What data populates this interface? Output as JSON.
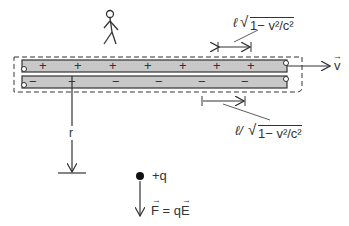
{
  "diagram": {
    "wire_top_charges": [
      "+",
      "+",
      "+",
      "+",
      "+",
      "+",
      "+"
    ],
    "wire_bottom_charges": [
      "−",
      "−",
      "−",
      "−",
      "−",
      "−"
    ],
    "velocity_label": "v",
    "top_spacing_label_l": "ℓ",
    "top_spacing_label_root": "1− v²/c²",
    "bottom_spacing_label_prefix": "ℓ/",
    "bottom_spacing_label_root": "1− v²/c²",
    "distance_label": "r",
    "charge_label": "+q",
    "force_label": "F = qE",
    "colors": {
      "wire_fill": "#c8c8c8",
      "stroke": "#333333",
      "background": "#ffffff"
    }
  }
}
